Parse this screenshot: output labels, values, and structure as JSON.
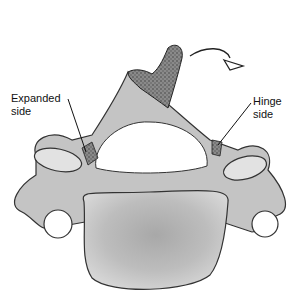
{
  "diagram": {
    "labels": {
      "expanded": [
        "Expanded",
        "side"
      ],
      "hinge": [
        "Hinge",
        "side"
      ]
    },
    "arrow": "rotation-arrow",
    "colors": {
      "bone": "#c9c9c9",
      "bone_dark": "#9a9a9a",
      "outline": "#333333",
      "graft": "#6e6e6e",
      "background": "#ffffff"
    }
  }
}
